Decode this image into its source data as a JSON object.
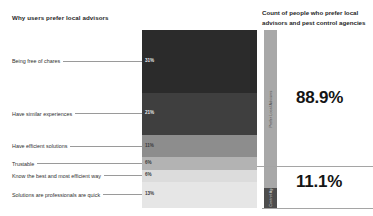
{
  "left_panel": {
    "title": "Why users prefer local advisors"
  },
  "right_panel": {
    "title": "Count of people who prefer local advisors and pest control agencies",
    "big_values": {
      "top": "88.9%",
      "bottom": "11.1%"
    }
  },
  "chart_data": {
    "type": "bar",
    "title": "Why users prefer local advisors",
    "subtitle": "Count of people who prefer local advisors and pest control agencies",
    "xlabel": "",
    "ylabel": "",
    "orientation": "stacked-vertical",
    "grid": false,
    "legend_position": "none",
    "categories": [
      "Being free of chares",
      "Have similar experiences",
      "Have efficient solutions",
      "Trustable",
      "Know the best and most efficient way",
      "Solutions are professionals are quick"
    ],
    "values": [
      31,
      21,
      11,
      6,
      6,
      13
    ],
    "value_labels": [
      "31%",
      "21%",
      "11%",
      "6%",
      "6%",
      "13%"
    ],
    "colors": [
      "#2b2b2b",
      "#3f3f3f",
      "#8d8d8d",
      "#b3b3b3",
      "#dcdcdc",
      "#e6e6e6"
    ],
    "label_on_dark": [
      true,
      true,
      false,
      false,
      false,
      false
    ],
    "secondary_series": {
      "name": "Count of people",
      "type": "bar",
      "categories": [
        "Prefer Local Advisors",
        "Pest Control Agency"
      ],
      "values": [
        88.9,
        11.1
      ],
      "value_labels": [
        "88.9%",
        "11.1%"
      ],
      "colors": [
        "#a8a8a8",
        "#4d4d4d"
      ],
      "label_on_dark": [
        false,
        true
      ]
    }
  }
}
